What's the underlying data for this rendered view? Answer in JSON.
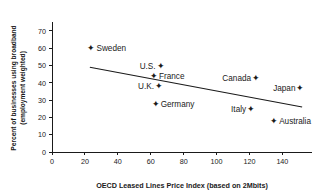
{
  "chart_data": {
    "type": "scatter",
    "title": "",
    "xlabel": "OECD Leased Lines Price Index (based on 2Mbits)",
    "ylabel": "Percent of businesses using broadband (employment weighted)",
    "ylabel_line1": "Percent of businesses using broadband",
    "ylabel_line2": "(employment weighted)",
    "xlim": [
      0,
      158
    ],
    "ylim": [
      0,
      74
    ],
    "xticks": [
      0,
      20,
      40,
      60,
      80,
      100,
      120,
      140
    ],
    "yticks": [
      0,
      10,
      20,
      30,
      40,
      50,
      60,
      70
    ],
    "grid": false,
    "legend": "none",
    "marker_glyph": "✦",
    "series": [
      {
        "name": "OECD countries",
        "points": [
          {
            "label": "Sweden",
            "x": 24,
            "y": 60,
            "label_side": "right"
          },
          {
            "label": "U.S.",
            "x": 66,
            "y": 50,
            "label_side": "left"
          },
          {
            "label": "France",
            "x": 62,
            "y": 44,
            "label_side": "right"
          },
          {
            "label": "U.K.",
            "x": 65,
            "y": 38,
            "label_side": "left"
          },
          {
            "label": "Germany",
            "x": 63,
            "y": 28,
            "label_side": "right"
          },
          {
            "label": "Canada",
            "x": 124,
            "y": 43,
            "label_side": "left"
          },
          {
            "label": "Japan",
            "x": 151,
            "y": 37,
            "label_side": "left"
          },
          {
            "label": "Italy",
            "x": 121,
            "y": 25,
            "label_side": "left"
          },
          {
            "label": "Australia",
            "x": 135,
            "y": 18,
            "label_side": "right"
          }
        ]
      }
    ],
    "trendline": {
      "x0": 23,
      "y0": 49,
      "x1": 152,
      "y1": 26
    },
    "colors": {
      "axis": "#1a1a1a",
      "text": "#1a1a1a",
      "marker": "#1a1a1a",
      "trend": "#1a1a1a",
      "background": "#ffffff"
    }
  }
}
